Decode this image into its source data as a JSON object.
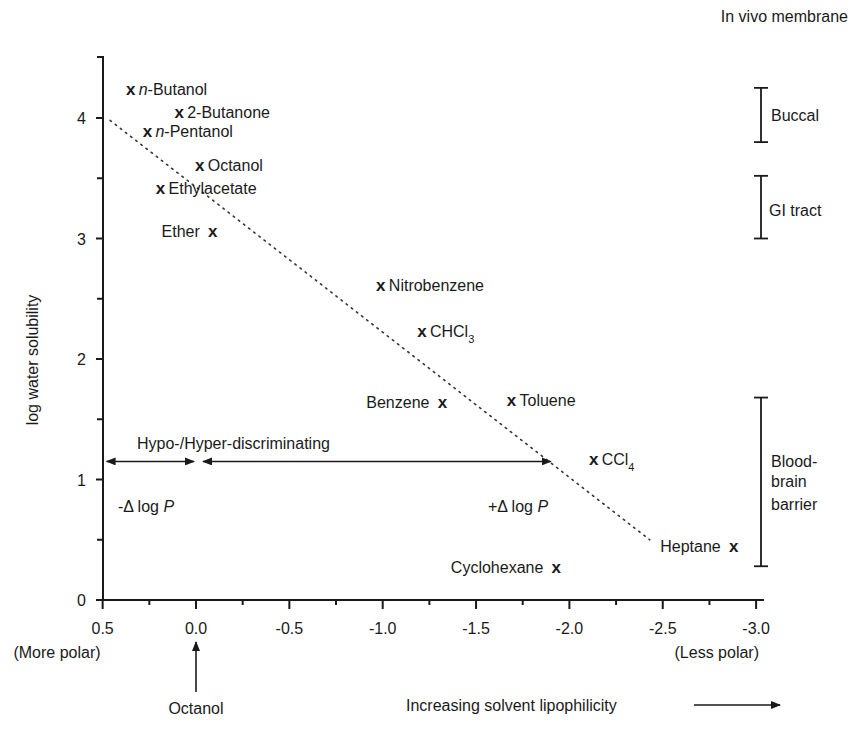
{
  "chart_data": {
    "type": "scatter",
    "title": "",
    "xlabel": "Increasing solvent lipophilicity",
    "ylabel": "log water solubility",
    "xlim": [
      0.5,
      -3.0
    ],
    "ylim": [
      0,
      4.5
    ],
    "x_ticks": [
      "0.5",
      "0.0",
      "-0.5",
      "-1.0",
      "-1.5",
      "-2.0",
      "-2.5",
      "-3.0"
    ],
    "x_tick_values": [
      0.5,
      0.0,
      -0.5,
      -1.0,
      -1.5,
      -2.0,
      -2.5,
      -3.0
    ],
    "y_ticks": [
      "0",
      "1",
      "2",
      "3",
      "4"
    ],
    "y_tick_values": [
      0,
      1,
      2,
      3,
      4
    ],
    "x_axis_left_note": "(More polar)",
    "x_axis_right_note": "(Less polar)",
    "grid": false,
    "legend": "none",
    "marker": "x",
    "series": [
      {
        "name": "Solvents",
        "points": [
          {
            "label": "n-Butanol",
            "italic_prefix": "n",
            "x": 0.35,
            "y": 4.24,
            "label_side": "right"
          },
          {
            "label": "2-Butanone",
            "x": 0.09,
            "y": 4.05,
            "label_side": "right"
          },
          {
            "label": "n-Pentanol",
            "italic_prefix": "n",
            "x": 0.26,
            "y": 3.89,
            "label_side": "right"
          },
          {
            "label": "Octanol",
            "x": -0.02,
            "y": 3.61,
            "label_side": "right"
          },
          {
            "label": "Ethylacetate",
            "x": 0.19,
            "y": 3.42,
            "label_side": "right"
          },
          {
            "label": "Ether",
            "x": -0.09,
            "y": 3.06,
            "label_side": "left"
          },
          {
            "label": "Nitrobenzene",
            "x": -0.99,
            "y": 2.61,
            "label_side": "right"
          },
          {
            "label": "CHCl3",
            "display": "CHCl",
            "subscript": "3",
            "x": -1.21,
            "y": 2.23,
            "label_side": "right"
          },
          {
            "label": "Benzene",
            "x": -1.32,
            "y": 1.64,
            "label_side": "left"
          },
          {
            "label": "Toluene",
            "x": -1.69,
            "y": 1.66,
            "label_side": "right"
          },
          {
            "label": "CCl4",
            "display": "CCl",
            "subscript": "4",
            "x": -2.13,
            "y": 1.17,
            "label_side": "right"
          },
          {
            "label": "Heptane",
            "x": -2.88,
            "y": 0.45,
            "label_side": "left"
          },
          {
            "label": "Cyclohexane",
            "x": -1.93,
            "y": 0.27,
            "label_side": "left"
          }
        ]
      }
    ],
    "trend_line": {
      "style": "dotted",
      "x1": 0.46,
      "y1": 3.98,
      "x2": -2.43,
      "y2": 0.5
    },
    "annotations": {
      "discrimination_label": "Hypo-/Hyper-discriminating",
      "arrow_y": 1.15,
      "left_arrow": {
        "from": 0.5,
        "to": 0.0,
        "label": "-Δ log P"
      },
      "right_arrow": {
        "from": 0.0,
        "to": -1.9,
        "label": "+Δ log P"
      },
      "octanol_marker": {
        "x": 0.0,
        "label": "Octanol"
      }
    },
    "membrane_ranges": {
      "title": "In vivo membrane",
      "ranges": [
        {
          "name": "Buccal",
          "y_low": 3.8,
          "y_high": 4.25
        },
        {
          "name": "GI tract",
          "y_low": 3.0,
          "y_high": 3.52
        },
        {
          "name": "Blood-brain barrier",
          "lines": [
            "Blood-",
            "brain",
            "barrier"
          ],
          "y_low": 0.28,
          "y_high": 1.68
        }
      ]
    }
  },
  "labels": {
    "ylabel": "log water solubility",
    "xlabel": "Increasing solvent lipophilicity",
    "more_polar": "(More polar)",
    "less_polar": "(Less polar)",
    "octanol_ref": "Octanol",
    "discriminating": "Hypo-/Hyper-discriminating",
    "minus_dlogp_prefix": "-Δ log ",
    "plus_dlogp_prefix": "+Δ log ",
    "p_symbol": "P",
    "membrane_title": "In vivo membrane",
    "buccal": "Buccal",
    "gi_tract": "GI tract",
    "bbb_1": "Blood-",
    "bbb_2": "brain",
    "bbb_3": "barrier",
    "mark_glyph": "x"
  }
}
